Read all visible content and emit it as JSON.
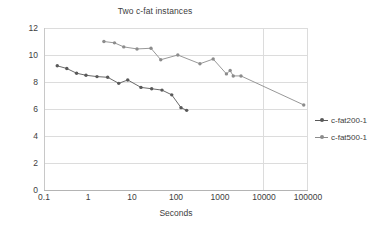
{
  "chart_data": {
    "type": "line",
    "title": "Two c-fat instances",
    "xlabel": "Seconds",
    "ylabel": "",
    "xscale": "log",
    "xlim": [
      0.1,
      100000
    ],
    "ylim": [
      0,
      12
    ],
    "grid": true,
    "legend_position": "right",
    "xticks": [
      "0.1",
      "1",
      "10",
      "100",
      "1000",
      "10000",
      "100000"
    ],
    "yticks": [
      "0",
      "2",
      "4",
      "6",
      "8",
      "10",
      "12"
    ],
    "series": [
      {
        "name": "c-fat200-1",
        "color": "#595959",
        "x": [
          0.2,
          0.33,
          0.55,
          0.9,
          1.6,
          2.8,
          5.0,
          8.0,
          16,
          28,
          48,
          80,
          130,
          175
        ],
        "y": [
          9.2,
          9.0,
          8.65,
          8.5,
          8.4,
          8.35,
          7.9,
          8.15,
          7.6,
          7.5,
          7.4,
          7.05,
          6.1,
          5.9
        ]
      },
      {
        "name": "c-fat500-1",
        "color": "#8c8c8c",
        "x": [
          2.3,
          4.0,
          6.5,
          13,
          27,
          45,
          110,
          350,
          700,
          1400,
          1700,
          2000,
          3000,
          80000
        ],
        "y": [
          11.0,
          10.9,
          10.6,
          10.45,
          10.5,
          9.65,
          10.0,
          9.35,
          9.7,
          8.6,
          8.85,
          8.45,
          8.45,
          6.3
        ]
      }
    ]
  },
  "legend": {
    "items": [
      {
        "label": "c-fat200-1",
        "color": "#595959"
      },
      {
        "label": "c-fat500-1",
        "color": "#8c8c8c"
      }
    ]
  }
}
